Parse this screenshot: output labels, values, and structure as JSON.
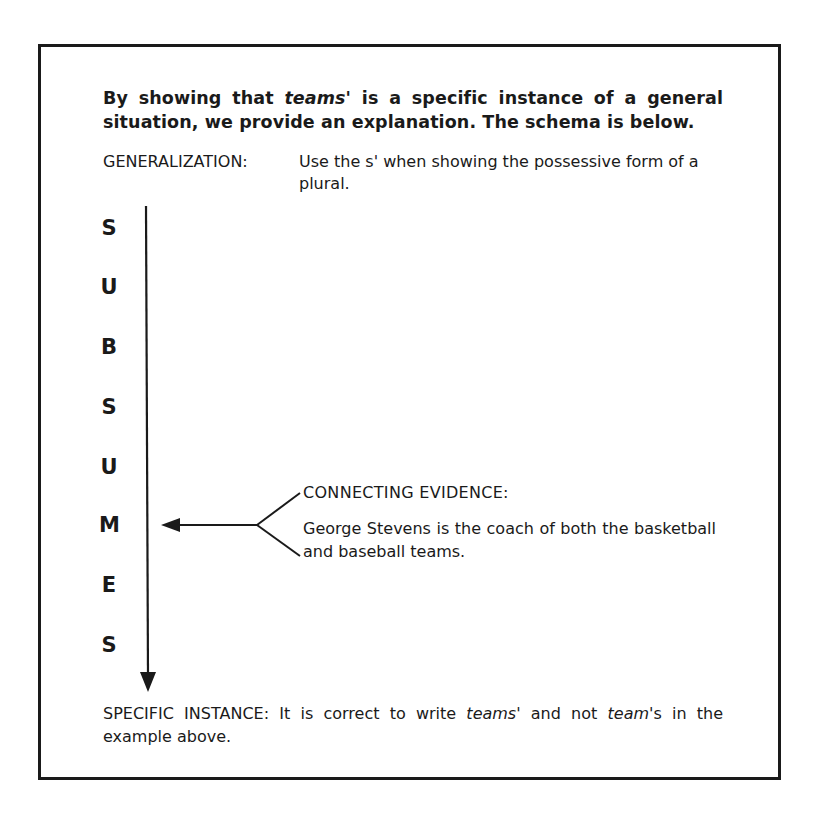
{
  "heading": {
    "part1": "By showing that ",
    "italic": "teams'",
    "part2": " is a specific instance of a general situation, we provide an explanation. The schema is below."
  },
  "generalization": {
    "label": "GENERALIZATION:",
    "text": "Use the s' when showing the possessive form of a plural."
  },
  "vertical_word": {
    "letters": [
      "S",
      "U",
      "B",
      "S",
      "U",
      "M",
      "E",
      "S"
    ],
    "word": "SUBSUMES"
  },
  "connecting_evidence": {
    "label": "CONNECTING EVIDENCE:",
    "text": "George Stevens is the coach of both the basketball and baseball teams."
  },
  "specific_instance": {
    "part1": "SPECIFIC INSTANCE: It is correct to write ",
    "italic1": "teams",
    "part2": "' and not ",
    "italic2": "team",
    "part3": "'s in the example above."
  },
  "colors": {
    "ink": "#1a1a1a",
    "background": "#ffffff"
  }
}
